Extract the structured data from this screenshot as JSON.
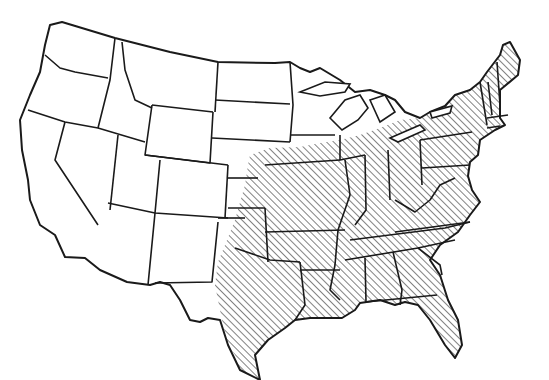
{
  "map": {
    "subject": "Contiguous United States",
    "style": "black-and-white line map",
    "hatch_color": "#1a1a1a",
    "background_color": "#ffffff",
    "hatched_region_label": "Eastern and southern states (hatched)",
    "hatched_states": [
      "Texas (eastern part)",
      "Oklahoma (eastern part)",
      "Kansas (eastern part)",
      "Nebraska (southeastern part)",
      "Missouri",
      "Iowa (southern part)",
      "Arkansas",
      "Louisiana",
      "Mississippi",
      "Alabama",
      "Georgia",
      "Florida",
      "South Carolina",
      "North Carolina",
      "Tennessee",
      "Kentucky",
      "Illinois",
      "Indiana",
      "Ohio",
      "West Virginia",
      "Virginia",
      "Maryland",
      "Delaware",
      "Pennsylvania",
      "New Jersey",
      "New York",
      "Connecticut",
      "Rhode Island",
      "Massachusetts",
      "Vermont",
      "New Hampshire",
      "Maine"
    ],
    "unhatched_states": [
      "Washington",
      "Oregon",
      "California",
      "Nevada",
      "Idaho",
      "Montana",
      "Wyoming",
      "Utah",
      "Arizona",
      "Colorado",
      "New Mexico",
      "North Dakota",
      "South Dakota",
      "Minnesota",
      "Wisconsin",
      "Michigan"
    ]
  }
}
